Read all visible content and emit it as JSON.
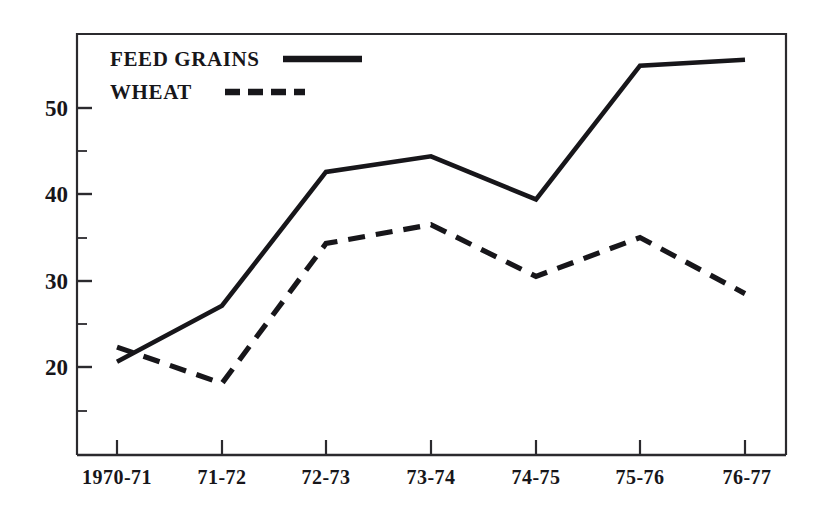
{
  "chart_data": {
    "type": "line",
    "title": "",
    "subtitle": "",
    "xlabel": "",
    "ylabel": "",
    "categories": [
      "1970-71",
      "71-72",
      "72-73",
      "73-74",
      "74-75",
      "75-76",
      "76-77"
    ],
    "ylim": [
      13,
      58
    ],
    "xlim": [
      0,
      6
    ],
    "y_ticks_major": [
      20,
      30,
      40,
      50
    ],
    "y_ticks_minor": [
      15,
      25,
      35,
      45,
      55
    ],
    "y_tick_labels": [
      "20",
      "30",
      "40",
      "50"
    ],
    "grid": false,
    "legend_position": "top-left-inside",
    "series": [
      {
        "name": "FEED GRAINS",
        "style": "solid",
        "color": "#17161a",
        "values": [
          20.6,
          27.1,
          42.6,
          44.4,
          39.4,
          54.9,
          55.6
        ]
      },
      {
        "name": "WHEAT",
        "style": "dashed",
        "color": "#17161a",
        "values": [
          22.3,
          18.1,
          34.3,
          36.5,
          30.5,
          35.0,
          28.5
        ]
      }
    ]
  },
  "legend": {
    "items": [
      {
        "label": "FEED GRAINS",
        "style": "solid"
      },
      {
        "label": "WHEAT",
        "style": "dashed"
      }
    ]
  },
  "axes": {
    "y_labels": [
      "50",
      "40",
      "30",
      "20"
    ],
    "x_labels": [
      "1970-71",
      "71-72",
      "72-73",
      "73-74",
      "74-75",
      "75-76",
      "76-77"
    ]
  },
  "colors": {
    "ink": "#17161a",
    "frame": "#2b2a2e",
    "background": "#ffffff"
  }
}
